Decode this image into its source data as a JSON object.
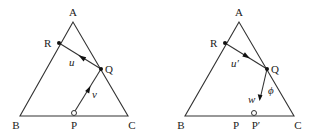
{
  "diagrams": [
    {
      "id": "left",
      "vertices": {
        "A": {
          "label": "A"
        },
        "B": {
          "label": "B"
        },
        "C": {
          "label": "C"
        }
      },
      "points": {
        "P": {
          "label": "P"
        },
        "Q": {
          "label": "Q"
        },
        "R": {
          "label": "R"
        }
      },
      "vectors": {
        "QR": {
          "label": "u"
        },
        "PQ": {
          "label": "v"
        }
      }
    },
    {
      "id": "right",
      "vertices": {
        "A": {
          "label": "A"
        },
        "B": {
          "label": "B"
        },
        "C": {
          "label": "C"
        }
      },
      "points": {
        "P": {
          "label": "P"
        },
        "P_prime": {
          "label": "P′"
        },
        "Q": {
          "label": "Q"
        },
        "R": {
          "label": "R"
        }
      },
      "vectors": {
        "QR": {
          "label": "u′"
        },
        "Qw": {
          "label": "w"
        }
      },
      "angle": {
        "label": "ϕ"
      }
    }
  ],
  "colors": {
    "stroke": "#333333",
    "text": "#222222",
    "background": "#ffffff"
  }
}
